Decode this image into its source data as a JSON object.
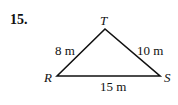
{
  "problem": {
    "number": "15."
  },
  "triangle": {
    "vertices": {
      "T": "T",
      "R": "R",
      "S": "S"
    },
    "sides": {
      "RT": "8 m",
      "TS": "10 m",
      "RS": "15 m"
    }
  }
}
